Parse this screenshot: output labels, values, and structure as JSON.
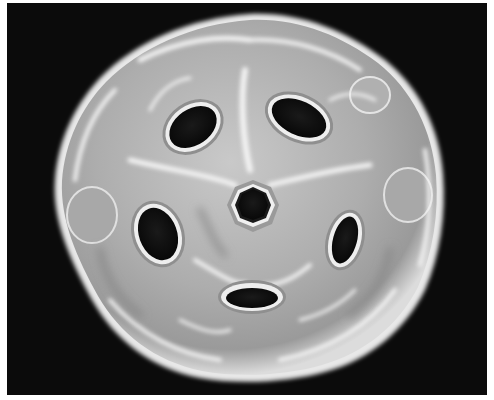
{
  "image": {
    "subject": "grayscale 3D rendered spherical cage structure with holes",
    "background_color": "#0b0b0b",
    "border_color": "#ffffff",
    "surface_color": "#b8b8b8",
    "highlight_color": "#f2f2f2",
    "hole_color": "#121212",
    "holes": [
      {
        "name": "upper-left",
        "cx": 193,
        "cy": 127,
        "rx": 28,
        "ry": 20,
        "rot": -35
      },
      {
        "name": "upper-right",
        "cx": 299,
        "cy": 118,
        "rx": 31,
        "ry": 19,
        "rot": 25
      },
      {
        "name": "center",
        "cx": 253,
        "cy": 207,
        "rx": 20,
        "ry": 21,
        "rot": 0
      },
      {
        "name": "left",
        "cx": 158,
        "cy": 234,
        "rx": 21,
        "ry": 29,
        "rot": -20
      },
      {
        "name": "right",
        "cx": 345,
        "cy": 240,
        "rx": 14,
        "ry": 26,
        "rot": 15
      },
      {
        "name": "bottom",
        "cx": 252,
        "cy": 297,
        "rx": 28,
        "ry": 12,
        "rot": 0
      }
    ]
  }
}
